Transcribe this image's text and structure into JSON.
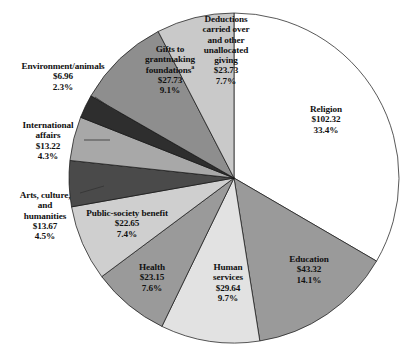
{
  "chart_data": {
    "type": "pie",
    "title": "",
    "subtitle": "",
    "xlabel": "",
    "ylabel": "",
    "legend_position": "labels-on-slices",
    "grid": false,
    "value_prefix": "$",
    "categories": [
      "Religion",
      "Education",
      "Human services",
      "Health",
      "Public-society benefit",
      "Arts, culture, and humanities",
      "International affairs",
      "Environment/animals",
      "Gifts to grantmaking foundations",
      "Deductions carried over and other unallocated giving"
    ],
    "values": [
      102.32,
      43.32,
      29.64,
      23.15,
      22.65,
      13.67,
      13.22,
      6.96,
      27.73,
      23.73
    ],
    "percents": [
      33.4,
      14.1,
      9.7,
      7.6,
      7.4,
      4.5,
      4.3,
      2.3,
      9.1,
      7.7
    ],
    "colors": [
      "#ffffff",
      "#9a9a9a",
      "#e2e2e2",
      "#9a9a9a",
      "#cfcfcf",
      "#4a4a4a",
      "#a8a8a8",
      "#2e2e2e",
      "#8e8e8e",
      "#c9c9c9"
    ],
    "slices": [
      {
        "name": "Religion",
        "value": 102.32,
        "value_text": "$102.32",
        "percent": 33.4,
        "percent_text": "33.4%",
        "color": "#ffffff",
        "start_angle": 0,
        "end_angle": 120.24,
        "label_placement": "inside"
      },
      {
        "name": "Education",
        "value": 43.32,
        "value_text": "$43.32",
        "percent": 14.1,
        "percent_text": "14.1%",
        "color": "#9a9a9a",
        "start_angle": 120.24,
        "end_angle": 171.0,
        "label_placement": "inside"
      },
      {
        "name": "Human\nservices",
        "value": 29.64,
        "value_text": "$29.64",
        "percent": 9.7,
        "percent_text": "9.7%",
        "color": "#e2e2e2",
        "start_angle": 171.0,
        "end_angle": 205.92,
        "label_placement": "inside"
      },
      {
        "name": "Health",
        "value": 23.15,
        "value_text": "$23.15",
        "percent": 7.6,
        "percent_text": "7.6%",
        "color": "#9a9a9a",
        "start_angle": 205.92,
        "end_angle": 233.28,
        "label_placement": "inside"
      },
      {
        "name": "Public-society benefit",
        "value": 22.65,
        "value_text": "$22.65",
        "percent": 7.4,
        "percent_text": "7.4%",
        "color": "#cfcfcf",
        "start_angle": 233.28,
        "end_angle": 259.92,
        "label_placement": "inside"
      },
      {
        "name": "Arts, culture,\nand\nhumanities",
        "value": 13.67,
        "value_text": "$13.67",
        "percent": 4.5,
        "percent_text": "4.5%",
        "color": "#4a4a4a",
        "start_angle": 259.92,
        "end_angle": 276.12,
        "label_placement": "outside-left",
        "leader": true
      },
      {
        "name": "International\naffairs",
        "value": 13.22,
        "value_text": "$13.22",
        "percent": 4.3,
        "percent_text": "4.3%",
        "color": "#a8a8a8",
        "start_angle": 276.12,
        "end_angle": 291.6,
        "label_placement": "outside-left",
        "leader": true
      },
      {
        "name": "Environment/animals",
        "value": 6.96,
        "value_text": "$6.96",
        "percent": 2.3,
        "percent_text": "2.3%",
        "color": "#2e2e2e",
        "start_angle": 291.6,
        "end_angle": 299.88,
        "label_placement": "outside-left",
        "leader": true
      },
      {
        "name": "Gifts to\ngrantmaking\nfoundations",
        "name_superscript": "a",
        "value": 27.73,
        "value_text": "$27.73",
        "percent": 9.1,
        "percent_text": "9.1%",
        "color": "#8e8e8e",
        "start_angle": 299.88,
        "end_angle": 332.64,
        "label_placement": "inside"
      },
      {
        "name": "Deductions\ncarried over\nand other\nunallocated\ngiving",
        "value": 23.73,
        "value_text": "$23.73",
        "percent": 7.7,
        "percent_text": "7.7%",
        "color": "#c9c9c9",
        "start_angle": 332.64,
        "end_angle": 360,
        "label_placement": "inside"
      }
    ]
  },
  "labels": {
    "religion": {
      "name": "Religion",
      "value": "$102.32",
      "percent": "33.4%"
    },
    "education": {
      "name": "Education",
      "value": "$43.32",
      "percent": "14.1%"
    },
    "human_services": {
      "name": "Human\nservices",
      "value": "$29.64",
      "percent": "9.7%"
    },
    "health": {
      "name": "Health",
      "value": "$23.15",
      "percent": "7.6%"
    },
    "public_society": {
      "name": "Public-society benefit",
      "value": "$22.65",
      "percent": "7.4%"
    },
    "arts": {
      "name": "Arts, culture,\nand\nhumanities",
      "value": "$13.67",
      "percent": "4.5%"
    },
    "international": {
      "name": "International\naffairs",
      "value": "$13.22",
      "percent": "4.3%"
    },
    "environment": {
      "name": "Environment/animals",
      "value": "$6.96",
      "percent": "2.3%"
    },
    "gifts": {
      "name": "Gifts to\ngrantmaking\nfoundations",
      "superscript": "a",
      "value": "$27.73",
      "percent": "9.1%"
    },
    "deductions": {
      "name": "Deductions\ncarried over\nand other\nunallocated\ngiving",
      "value": "$23.73",
      "percent": "7.7%"
    }
  }
}
